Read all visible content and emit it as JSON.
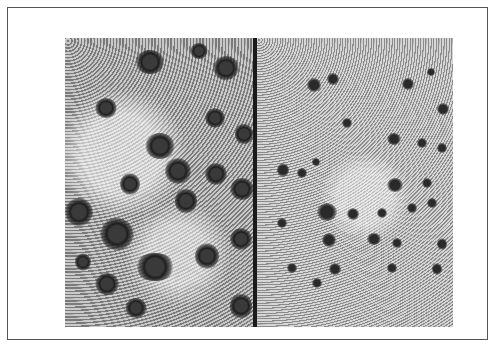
{
  "figure": {
    "type": "micrograph",
    "panels": [
      {
        "id": "left",
        "description": "grayscale micrograph with large dark stained clusters"
      },
      {
        "id": "right",
        "description": "grayscale micrograph with smaller, more numerous dark stained dots"
      }
    ],
    "divider_color": "#1a1a1a",
    "border_color": "#555555"
  }
}
